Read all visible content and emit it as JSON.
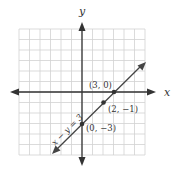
{
  "chart_data": {
    "type": "line",
    "title": "",
    "xlabel": "x",
    "ylabel": "y",
    "xlim": [
      -6,
      6
    ],
    "ylim": [
      -6,
      6
    ],
    "grid": true,
    "grid_step": 1,
    "series": [
      {
        "name": "x − y = 3",
        "equation": "x - y = 3",
        "x": [
          -3,
          6
        ],
        "y": [
          -6,
          3
        ]
      }
    ],
    "points": [
      {
        "x": 3,
        "y": 0,
        "label": "(3, 0)"
      },
      {
        "x": 2,
        "y": -1,
        "label": "(2, −1)"
      },
      {
        "x": 0,
        "y": -3,
        "label": "(0, −3)"
      }
    ],
    "annotations": [
      "x − y = 3"
    ]
  },
  "labels": {
    "x_axis": "x",
    "y_axis": "y",
    "equation": "x − y = 3",
    "point_a": "(3, 0)",
    "point_b": "(2, −1)",
    "point_c": "(0, −3)"
  },
  "colors": {
    "grid": "#d2d2d2",
    "axis": "#333333",
    "line": "#444444"
  }
}
